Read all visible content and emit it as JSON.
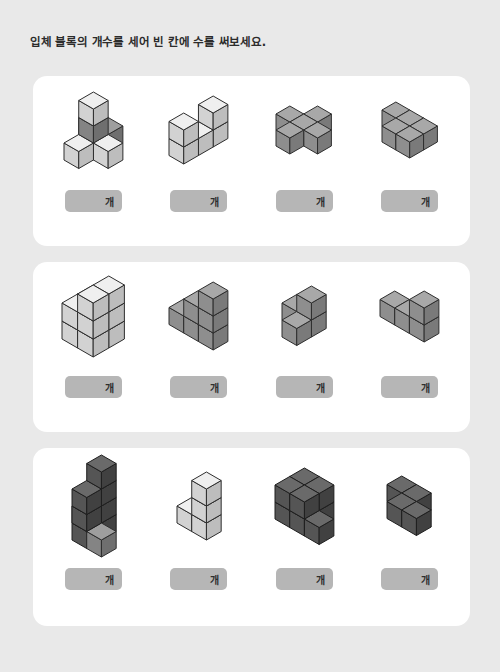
{
  "worksheet": {
    "title": "입체 블록의 개수를 세어 빈 칸에 수를 써보세요.",
    "unit_label": "개",
    "background_color": "#e9e9e9",
    "card_color": "#ffffff",
    "answer_box_color": "#b6b6b6"
  },
  "palette": {
    "light": {
      "top": "#efefef",
      "left": "#d2d2d2",
      "right": "#bdbdbd",
      "stroke": "#2e2e2e"
    },
    "medium": {
      "top": "#a8a8a8",
      "left": "#8e8e8e",
      "right": "#7a7a7a",
      "stroke": "#2e2e2e"
    },
    "dark": {
      "top": "#6a6a6a",
      "left": "#555555",
      "right": "#414141",
      "stroke": "#1f1f1f"
    },
    "mixed_light": {
      "top": "#e4e4e4",
      "left": "#c6c6c6",
      "right": "#b0b0b0",
      "stroke": "#2e2e2e"
    },
    "mixed_dark": {
      "top": "#9e9e9e",
      "left": "#848484",
      "right": "#6f6f6f",
      "stroke": "#2e2e2e"
    }
  },
  "rows": [
    {
      "row_index": 1,
      "problems": [
        {
          "id": "p1",
          "answer_label": "개",
          "shade": "mixed",
          "cube_size": 17,
          "cubes": [
            {
              "x": 0,
              "y": 0,
              "z": 0,
              "tone": "light"
            },
            {
              "x": 1,
              "y": 0,
              "z": 0,
              "tone": "mixed_dark"
            },
            {
              "x": 1,
              "y": 1,
              "z": 0,
              "tone": "light"
            },
            {
              "x": 2,
              "y": 1,
              "z": 0,
              "tone": "light"
            },
            {
              "x": 1,
              "y": 2,
              "z": 0,
              "tone": "light"
            },
            {
              "x": 1,
              "y": 1,
              "z": 1,
              "tone": "mixed_dark"
            },
            {
              "x": 1,
              "y": 1,
              "z": 2,
              "tone": "light"
            }
          ]
        },
        {
          "id": "p2",
          "answer_label": "개",
          "shade": "light",
          "cube_size": 17,
          "cubes": [
            {
              "x": 0,
              "y": 0,
              "z": 0,
              "tone": "light"
            },
            {
              "x": 0,
              "y": 1,
              "z": 0,
              "tone": "light"
            },
            {
              "x": 0,
              "y": 2,
              "z": 0,
              "tone": "light"
            },
            {
              "x": 0,
              "y": 0,
              "z": 1,
              "tone": "light"
            },
            {
              "x": 0,
              "y": 2,
              "z": 1,
              "tone": "light"
            }
          ]
        },
        {
          "id": "p3",
          "answer_label": "개",
          "shade": "medium",
          "cube_size": 16,
          "cubes": [
            {
              "x": 1,
              "y": 0,
              "z": 0,
              "tone": "medium"
            },
            {
              "x": 0,
              "y": 1,
              "z": 0,
              "tone": "medium"
            },
            {
              "x": 1,
              "y": 1,
              "z": 0,
              "tone": "medium"
            },
            {
              "x": 2,
              "y": 1,
              "z": 0,
              "tone": "medium"
            },
            {
              "x": 1,
              "y": 2,
              "z": 0,
              "tone": "medium"
            }
          ]
        },
        {
          "id": "p4",
          "answer_label": "개",
          "shade": "medium",
          "cube_size": 16,
          "cubes": [
            {
              "x": 0,
              "y": 0,
              "z": 0,
              "tone": "medium"
            },
            {
              "x": 1,
              "y": 0,
              "z": 0,
              "tone": "medium"
            },
            {
              "x": 1,
              "y": 1,
              "z": 0,
              "tone": "medium"
            },
            {
              "x": 2,
              "y": 1,
              "z": 0,
              "tone": "medium"
            },
            {
              "x": 2,
              "y": 0,
              "z": 0,
              "tone": "medium"
            }
          ]
        }
      ]
    },
    {
      "row_index": 2,
      "problems": [
        {
          "id": "p5",
          "answer_label": "개",
          "shade": "light",
          "cube_size": 18,
          "cubes": [
            {
              "x": 0,
              "y": 0,
              "z": 0,
              "tone": "light"
            },
            {
              "x": 1,
              "y": 0,
              "z": 0,
              "tone": "light"
            },
            {
              "x": 0,
              "y": 1,
              "z": 0,
              "tone": "light"
            },
            {
              "x": 1,
              "y": 1,
              "z": 0,
              "tone": "light"
            },
            {
              "x": 0,
              "y": 0,
              "z": 1,
              "tone": "light"
            },
            {
              "x": 1,
              "y": 0,
              "z": 1,
              "tone": "light"
            },
            {
              "x": 0,
              "y": 1,
              "z": 1,
              "tone": "light"
            },
            {
              "x": 1,
              "y": 1,
              "z": 1,
              "tone": "light"
            },
            {
              "x": 1,
              "y": 0,
              "z": 2,
              "tone": "light"
            },
            {
              "x": 1,
              "y": 1,
              "z": 2,
              "tone": "light"
            }
          ]
        },
        {
          "id": "p6",
          "answer_label": "개",
          "shade": "medium",
          "cube_size": 17,
          "cubes": [
            {
              "x": 0,
              "y": 0,
              "z": 0,
              "tone": "medium"
            },
            {
              "x": 1,
              "y": 0,
              "z": 0,
              "tone": "medium"
            },
            {
              "x": 2,
              "y": 0,
              "z": 0,
              "tone": "medium"
            },
            {
              "x": 1,
              "y": 0,
              "z": 1,
              "tone": "medium"
            },
            {
              "x": 2,
              "y": 0,
              "z": 1,
              "tone": "medium"
            },
            {
              "x": 2,
              "y": 0,
              "z": 2,
              "tone": "medium"
            }
          ]
        },
        {
          "id": "p7",
          "answer_label": "개",
          "shade": "medium",
          "cube_size": 17,
          "cubes": [
            {
              "x": 0,
              "y": 0,
              "z": 0,
              "tone": "medium"
            },
            {
              "x": 1,
              "y": 1,
              "z": 0,
              "tone": "medium"
            },
            {
              "x": 1,
              "y": 0,
              "z": 0,
              "tone": "medium"
            },
            {
              "x": 1,
              "y": 0,
              "z": 1,
              "tone": "medium"
            }
          ]
        },
        {
          "id": "p8",
          "answer_label": "개",
          "shade": "medium",
          "cube_size": 17,
          "cubes": [
            {
              "x": 0,
              "y": 0,
              "z": 0,
              "tone": "medium"
            },
            {
              "x": 1,
              "y": 0,
              "z": 0,
              "tone": "medium"
            },
            {
              "x": 2,
              "y": 0,
              "z": 0,
              "tone": "medium"
            },
            {
              "x": 2,
              "y": 0,
              "z": 1,
              "tone": "medium"
            }
          ]
        }
      ]
    },
    {
      "row_index": 3,
      "problems": [
        {
          "id": "p9",
          "answer_label": "개",
          "shade": "dark",
          "cube_size": 17,
          "cubes": [
            {
              "x": 0,
              "y": 0,
              "z": 0,
              "tone": "dark"
            },
            {
              "x": 1,
              "y": 0,
              "z": 0,
              "tone": "dark"
            },
            {
              "x": 1,
              "y": 1,
              "z": 0,
              "tone": "dark"
            },
            {
              "x": 2,
              "y": 1,
              "z": 0,
              "tone": "mixed_dark"
            },
            {
              "x": 1,
              "y": 0,
              "z": 1,
              "tone": "dark"
            },
            {
              "x": 1,
              "y": 1,
              "z": 1,
              "tone": "dark"
            },
            {
              "x": 1,
              "y": 0,
              "z": 2,
              "tone": "dark"
            },
            {
              "x": 1,
              "y": 1,
              "z": 2,
              "tone": "dark"
            },
            {
              "x": 1,
              "y": 0,
              "z": 3,
              "tone": "dark"
            }
          ]
        },
        {
          "id": "p10",
          "answer_label": "개",
          "shade": "light",
          "cube_size": 17,
          "cubes": [
            {
              "x": 0,
              "y": 0,
              "z": 0,
              "tone": "light"
            },
            {
              "x": 1,
              "y": 0,
              "z": 0,
              "tone": "light"
            },
            {
              "x": 1,
              "y": 0,
              "z": 1,
              "tone": "light"
            },
            {
              "x": 1,
              "y": 0,
              "z": 2,
              "tone": "light"
            }
          ]
        },
        {
          "id": "p11",
          "answer_label": "개",
          "shade": "dark",
          "cube_size": 17,
          "cubes": [
            {
              "x": 0,
              "y": 0,
              "z": 0,
              "tone": "dark"
            },
            {
              "x": 1,
              "y": 0,
              "z": 0,
              "tone": "dark"
            },
            {
              "x": 0,
              "y": 1,
              "z": 0,
              "tone": "dark"
            },
            {
              "x": 1,
              "y": 1,
              "z": 0,
              "tone": "dark"
            },
            {
              "x": 2,
              "y": 1,
              "z": 0,
              "tone": "dark"
            },
            {
              "x": 0,
              "y": 0,
              "z": 1,
              "tone": "dark"
            },
            {
              "x": 1,
              "y": 0,
              "z": 1,
              "tone": "dark"
            },
            {
              "x": 0,
              "y": 1,
              "z": 1,
              "tone": "dark"
            },
            {
              "x": 1,
              "y": 1,
              "z": 1,
              "tone": "dark"
            }
          ]
        },
        {
          "id": "p12",
          "answer_label": "개",
          "shade": "dark",
          "cube_size": 17,
          "cubes": [
            {
              "x": 0,
              "y": 0,
              "z": 0,
              "tone": "dark"
            },
            {
              "x": 1,
              "y": 0,
              "z": 0,
              "tone": "dark"
            },
            {
              "x": 1,
              "y": 1,
              "z": 0,
              "tone": "dark"
            },
            {
              "x": 2,
              "y": 1,
              "z": 0,
              "tone": "dark"
            }
          ]
        }
      ]
    }
  ]
}
